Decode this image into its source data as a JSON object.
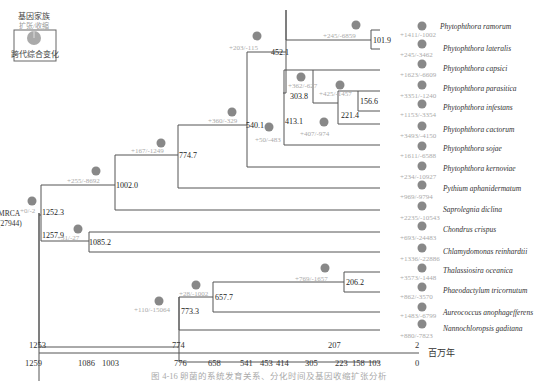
{
  "legend": {
    "title": "基因家族",
    "subtitle": "扩张/收缩",
    "box_label": "跨代综合变化"
  },
  "root": {
    "label_line1": "MRCA",
    "label_line2": "(27944)",
    "age": "1257.9"
  },
  "nodes": [
    {
      "id": "n1252",
      "age": "1252.3",
      "gl": "+0/-2"
    },
    {
      "id": "n1085",
      "age": "1085.2",
      "gl": "+31/-27"
    },
    {
      "id": "n1002",
      "age": "1002.0",
      "gl": "+255/-8692"
    },
    {
      "id": "n774",
      "age": "774.7",
      "gl": "+167/-1249"
    },
    {
      "id": "n540",
      "age": "540.1",
      "gl": "+360/-329"
    },
    {
      "id": "n452",
      "age": "452.1",
      "gl": "+203/-115"
    },
    {
      "id": "n413",
      "age": "413.1",
      "gl": "+50/-483"
    },
    {
      "id": "n303",
      "age": "303.8",
      "gl": "+362/-627"
    },
    {
      "id": "n221",
      "age": "221.4",
      "gl": "+407/-974"
    },
    {
      "id": "n156",
      "age": "156.6",
      "gl": "+425/-1457"
    },
    {
      "id": "n101",
      "age": "101.9",
      "gl": "+245/-6859"
    },
    {
      "id": "n773",
      "age": "773.3",
      "gl": "+110/-15064"
    },
    {
      "id": "n657",
      "age": "657.7",
      "gl": "+28/-1002"
    },
    {
      "id": "n206",
      "age": "206.2",
      "gl": "+769/-1657"
    }
  ],
  "taxa": [
    {
      "name": "Phytophthora ramorum",
      "gl": "+1411/-1002"
    },
    {
      "name": "Phytophthora lateralis",
      "gl": "+245/-3462"
    },
    {
      "name": "Phytophthora capsici",
      "gl": "+1623/-6609"
    },
    {
      "name": "Phytophthora parasitica",
      "gl": "+3351/-1240"
    },
    {
      "name": "Phytophthora infestans",
      "gl": "+1153/-3354"
    },
    {
      "name": "Phytophthora cactorum",
      "gl": "+3493/-4150"
    },
    {
      "name": "Phytophthora sojae",
      "gl": "+1611/-6588"
    },
    {
      "name": "Phytophthora kernoviae",
      "gl": "+234/-10927"
    },
    {
      "name": "Pythium aphanidermatum",
      "gl": "+969/-9794"
    },
    {
      "name": "Saprolegnia diclina",
      "gl": "+2235/-10543"
    },
    {
      "name": "Chondrus crispus",
      "gl": "+693/-24483"
    },
    {
      "name": "Chlamydomonas reinhardtii",
      "gl": "+1336/-22886"
    },
    {
      "name": "Thalassiosira oceanica",
      "gl": "+3573/-1448"
    },
    {
      "name": "Phaeodactylum tricornutum",
      "gl": "+862/-3570"
    },
    {
      "name": "Aureococcus anophagefferens",
      "gl": "+1483/-6799"
    },
    {
      "name": "Nannochloropsis gaditana",
      "gl": "+880/-7823"
    }
  ],
  "axis": {
    "unit": "百万年",
    "top_ticks": [
      "1253",
      "774",
      "207",
      "2"
    ],
    "bottom_ticks": [
      "1259",
      "1086",
      "1003",
      "776",
      "658",
      "541",
      "453",
      "414",
      "305",
      "223",
      "158",
      "103",
      "0"
    ]
  },
  "caption": "图 4-16  卵菌的系统发育关系、分化时间及基因收缩扩张分析",
  "colors": {
    "line": "#555555",
    "pie_main": "#888888",
    "pie_light": "#bbbbbb",
    "gain_loss_text": "#aaaaaa"
  }
}
